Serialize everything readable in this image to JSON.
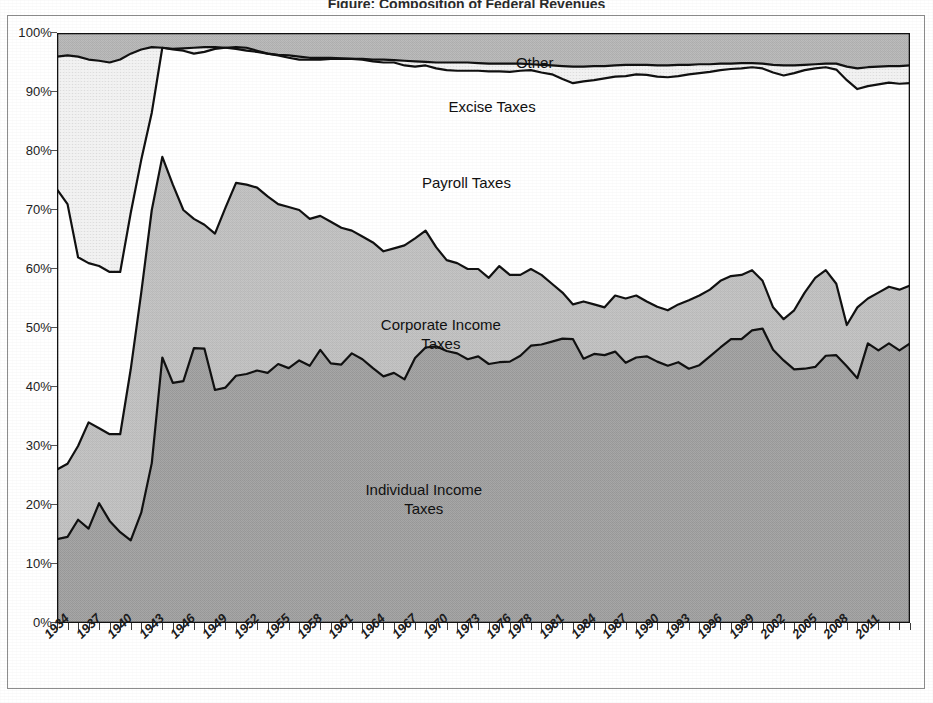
{
  "title": "Figure: Composition of Federal Revenues",
  "chart_data": {
    "type": "area",
    "stacked": "100%",
    "title": "Figure: Composition of Federal Revenues",
    "xlabel": "",
    "ylabel": "",
    "ylim": [
      0,
      100
    ],
    "xlim": [
      1934,
      2015
    ],
    "grid": false,
    "legend_position": "inline-labels",
    "y_tick_labels": [
      "0%",
      "10%",
      "20%",
      "30%",
      "40%",
      "50%",
      "60%",
      "70%",
      "80%",
      "90%",
      "100%"
    ],
    "y_tick_values": [
      0,
      10,
      20,
      30,
      40,
      50,
      60,
      70,
      80,
      90,
      100
    ],
    "x_tick_labels": [
      "1934",
      "1937",
      "1940",
      "1943",
      "1946",
      "1949",
      "1952",
      "1955",
      "1958",
      "1961",
      "1964",
      "1967",
      "1970",
      "1973",
      "1976",
      "1978",
      "1981",
      "1984",
      "1987",
      "1990",
      "1993",
      "1996",
      "1999",
      "2002",
      "2005",
      "2008",
      "2011"
    ],
    "x_tick_years": [
      1934,
      1937,
      1940,
      1943,
      1946,
      1949,
      1952,
      1955,
      1958,
      1961,
      1964,
      1967,
      1970,
      1973,
      1976,
      1978,
      1981,
      1984,
      1987,
      1990,
      1993,
      1996,
      1999,
      2002,
      2005,
      2008,
      2011
    ],
    "years": [
      1934,
      1935,
      1936,
      1937,
      1938,
      1939,
      1940,
      1941,
      1942,
      1943,
      1944,
      1945,
      1946,
      1947,
      1948,
      1949,
      1950,
      1951,
      1952,
      1953,
      1954,
      1955,
      1956,
      1957,
      1958,
      1959,
      1960,
      1961,
      1962,
      1963,
      1964,
      1965,
      1966,
      1967,
      1968,
      1969,
      1970,
      1971,
      1972,
      1973,
      1974,
      1975,
      1976,
      1977,
      1978,
      1979,
      1980,
      1981,
      1982,
      1983,
      1984,
      1985,
      1986,
      1987,
      1988,
      1989,
      1990,
      1991,
      1992,
      1993,
      1994,
      1995,
      1996,
      1997,
      1998,
      1999,
      2000,
      2001,
      2002,
      2003,
      2004,
      2005,
      2006,
      2007,
      2008,
      2009,
      2010,
      2011,
      2012,
      2013,
      2014,
      2015
    ],
    "series": [
      {
        "name": "Individual Income Taxes",
        "label": "Individual Income\nTaxes",
        "fill_color": "#a8a8a8",
        "values": [
          14.2,
          14.6,
          17.5,
          16.0,
          20.3,
          17.3,
          15.4,
          14.0,
          18.7,
          27.1,
          45.0,
          40.7,
          41.0,
          46.6,
          46.5,
          39.5,
          39.9,
          41.9,
          42.2,
          42.8,
          42.4,
          43.9,
          43.2,
          44.5,
          43.6,
          46.3,
          44.0,
          43.8,
          45.7,
          44.7,
          43.2,
          41.8,
          42.4,
          41.3,
          44.9,
          46.7,
          46.9,
          46.1,
          45.7,
          44.7,
          45.2,
          43.9,
          44.2,
          44.3,
          45.3,
          47.0,
          47.2,
          47.7,
          48.2,
          48.1,
          44.8,
          45.6,
          45.4,
          46.0,
          44.1,
          45.0,
          45.2,
          44.3,
          43.6,
          44.2,
          43.1,
          43.7,
          45.2,
          46.7,
          48.1,
          48.1,
          49.6,
          49.9,
          46.3,
          44.5,
          43.0,
          43.1,
          43.4,
          45.3,
          45.4,
          43.5,
          41.5,
          47.4,
          46.2,
          47.4,
          46.2,
          47.4
        ]
      },
      {
        "name": "Corporate Income Taxes",
        "label": "Corporate Income\nTaxes",
        "fill_color": "#c3c3c3",
        "values": [
          26.0,
          27.0,
          30.0,
          34.0,
          33.0,
          32.0,
          32.0,
          43.0,
          56.0,
          70.0,
          79.0,
          74.3,
          70.0,
          68.5,
          67.5,
          66.0,
          70.4,
          74.6,
          74.3,
          73.8,
          72.3,
          71.0,
          70.5,
          70.0,
          68.5,
          69.0,
          68.0,
          67.0,
          66.5,
          65.5,
          64.5,
          63.0,
          63.5,
          64.0,
          65.2,
          66.5,
          63.7,
          61.5,
          61.0,
          60.0,
          60.0,
          58.5,
          60.5,
          59.0,
          59.0,
          60.0,
          59.0,
          57.5,
          56.0,
          54.0,
          54.5,
          54.0,
          53.5,
          55.5,
          55.0,
          55.5,
          54.5,
          53.6,
          53.0,
          54.0,
          54.7,
          55.5,
          56.5,
          58.0,
          58.8,
          59.0,
          59.8,
          58.0,
          53.5,
          51.5,
          53.0,
          56.0,
          58.5,
          59.8,
          57.5,
          50.5,
          53.5,
          55.0,
          56.0,
          57.0,
          56.5,
          57.2
        ]
      },
      {
        "name": "Payroll Taxes",
        "label": "Payroll Taxes",
        "fill_color": "#ffffff",
        "values": [
          73.5,
          71.0,
          62.0,
          61.0,
          60.5,
          59.5,
          59.5,
          69.5,
          78.5,
          86.5,
          97.5,
          97.2,
          97.0,
          96.5,
          96.8,
          97.3,
          97.5,
          97.6,
          97.5,
          97.0,
          96.5,
          96.2,
          95.8,
          95.5,
          95.5,
          95.5,
          95.6,
          95.6,
          95.6,
          95.5,
          95.2,
          95.0,
          95.0,
          94.5,
          94.3,
          94.5,
          94.0,
          93.7,
          93.6,
          93.6,
          93.6,
          93.5,
          93.5,
          93.4,
          93.6,
          93.7,
          93.3,
          93.0,
          92.2,
          91.5,
          91.8,
          92.0,
          92.3,
          92.6,
          92.7,
          93.0,
          92.9,
          92.6,
          92.5,
          92.7,
          93.0,
          93.2,
          93.4,
          93.7,
          93.9,
          94.0,
          94.2,
          94.0,
          93.3,
          92.8,
          93.2,
          93.7,
          94.0,
          94.2,
          93.8,
          92.0,
          90.5,
          91.0,
          91.3,
          91.6,
          91.4,
          91.5
        ]
      },
      {
        "name": "Excise Taxes",
        "label": "Excise Taxes",
        "fill_color": "#efefef",
        "values": [
          96.0,
          96.2,
          96.0,
          95.5,
          95.3,
          95.0,
          95.5,
          96.5,
          97.2,
          97.6,
          97.5,
          97.3,
          97.4,
          97.5,
          97.6,
          97.6,
          97.5,
          97.3,
          97.0,
          96.8,
          96.5,
          96.3,
          96.2,
          96.0,
          95.8,
          95.8,
          95.8,
          95.7,
          95.6,
          95.6,
          95.5,
          95.5,
          95.4,
          95.3,
          95.2,
          95.1,
          95.0,
          95.0,
          95.0,
          95.0,
          94.9,
          94.8,
          94.8,
          94.8,
          94.8,
          94.7,
          94.6,
          94.5,
          94.4,
          94.3,
          94.3,
          94.4,
          94.4,
          94.5,
          94.6,
          94.6,
          94.6,
          94.5,
          94.5,
          94.6,
          94.6,
          94.7,
          94.7,
          94.8,
          94.8,
          94.9,
          94.9,
          94.8,
          94.6,
          94.5,
          94.5,
          94.6,
          94.7,
          94.8,
          94.8,
          94.3,
          94.0,
          94.2,
          94.3,
          94.4,
          94.4,
          94.5
        ]
      },
      {
        "name": "Other",
        "label": "Other",
        "fill_color": "#b9b9b9",
        "values": [
          100,
          100,
          100,
          100,
          100,
          100,
          100,
          100,
          100,
          100,
          100,
          100,
          100,
          100,
          100,
          100,
          100,
          100,
          100,
          100,
          100,
          100,
          100,
          100,
          100,
          100,
          100,
          100,
          100,
          100,
          100,
          100,
          100,
          100,
          100,
          100,
          100,
          100,
          100,
          100,
          100,
          100,
          100,
          100,
          100,
          100,
          100,
          100,
          100,
          100,
          100,
          100,
          100,
          100,
          100,
          100,
          100,
          100,
          100,
          100,
          100,
          100,
          100,
          100,
          100,
          100,
          100,
          100,
          100,
          100,
          100,
          100,
          100,
          100,
          100,
          100,
          100,
          100,
          100,
          100,
          100,
          100
        ]
      }
    ],
    "series_label_positions": [
      {
        "name": "Other",
        "x_pct": 56,
        "y_pct": 95.0
      },
      {
        "name": "Excise Taxes",
        "x_pct": 51,
        "y_pct": 87.5
      },
      {
        "name": "Payroll Taxes",
        "x_pct": 48,
        "y_pct": 74.5
      },
      {
        "name": "Corporate Income Taxes",
        "x_pct": 45,
        "y_pct": 50.5
      },
      {
        "name": "Individual Income Taxes",
        "x_pct": 43,
        "y_pct": 22.5
      }
    ],
    "colors": {
      "individual": "#a8a8a8",
      "corporate": "#c3c3c3",
      "payroll": "#ffffff",
      "excise": "#efefef",
      "other": "#b9b9b9",
      "line": "#111111",
      "frame": "#8d8d8d"
    }
  }
}
